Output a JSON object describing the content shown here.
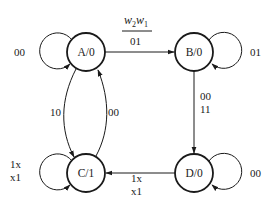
{
  "diagram": {
    "type": "state-diagram",
    "header": {
      "variables_numerator": [
        "w",
        "2",
        "w",
        "1"
      ],
      "variables_label": "w2w1",
      "example_input": "01"
    },
    "states": [
      {
        "id": "A",
        "label": "A/0",
        "output": "0"
      },
      {
        "id": "B",
        "label": "B/0",
        "output": "0"
      },
      {
        "id": "C",
        "label": "C/1",
        "output": "1"
      },
      {
        "id": "D",
        "label": "D/0",
        "output": "0"
      }
    ],
    "transitions": [
      {
        "from": "A",
        "to": "A",
        "label": "00"
      },
      {
        "from": "A",
        "to": "B",
        "label": "01"
      },
      {
        "from": "A",
        "to": "C",
        "label": "10"
      },
      {
        "from": "C",
        "to": "A",
        "label": "00"
      },
      {
        "from": "B",
        "to": "B",
        "label": "01"
      },
      {
        "from": "B",
        "to": "D",
        "label_lines": [
          "00",
          "11"
        ]
      },
      {
        "from": "D",
        "to": "D",
        "label": "00"
      },
      {
        "from": "D",
        "to": "C",
        "label_lines": [
          "1x",
          "x1"
        ]
      },
      {
        "from": "C",
        "to": "C",
        "label_lines": [
          "1x",
          "x1"
        ]
      }
    ]
  }
}
